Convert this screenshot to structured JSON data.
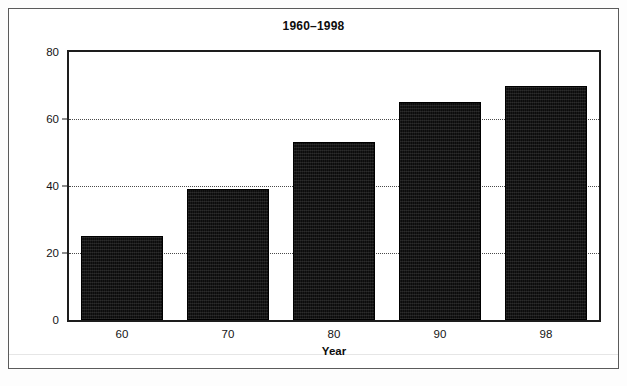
{
  "chart_data": {
    "type": "bar",
    "title": "1960–1998",
    "xlabel": "Year",
    "ylabel": "",
    "categories": [
      "60",
      "70",
      "80",
      "90",
      "98"
    ],
    "values": [
      25,
      39,
      53,
      65,
      70
    ],
    "ylim": [
      0,
      80
    ],
    "yticks": [
      0,
      20,
      40,
      60,
      80
    ],
    "ytick_labels": [
      "0",
      "20",
      "40",
      "60",
      "80"
    ],
    "gridlines": {
      "y": [
        20,
        40,
        60
      ],
      "style": "dotted",
      "x_grid": false
    },
    "legend": null,
    "bar_color": "#0c0c0c",
    "axis_color": "#1d1d1d",
    "frame_color": "#5b5b5b"
  }
}
